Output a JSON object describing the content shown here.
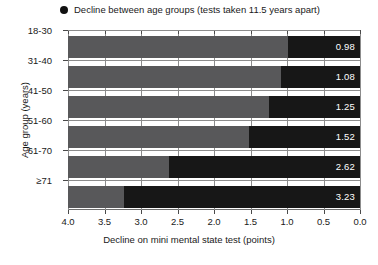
{
  "chart_data": {
    "type": "bar",
    "orientation": "horizontal",
    "title": "",
    "legend": {
      "position": "top-left",
      "marker": "filled-circle",
      "marker_color": "#111111",
      "entries": [
        {
          "label": "Decline between age groups (tests taken 11.5 years apart)"
        }
      ]
    },
    "categories": [
      "18-30",
      "31-40",
      "41-50",
      "51-60",
      "61-70",
      "≥71"
    ],
    "values": [
      0.98,
      1.08,
      1.25,
      1.52,
      2.62,
      3.23
    ],
    "data_labels": [
      "0.98",
      "1.08",
      "1.25",
      "1.52",
      "2.62",
      "3.23"
    ],
    "xlabel": "Decline on mini mental state test (points)",
    "ylabel": "Age group (years)",
    "xlim": [
      4.0,
      0.0
    ],
    "x_axis_reversed": true,
    "xticks": [
      4.0,
      3.5,
      3.0,
      2.5,
      2.0,
      1.5,
      1.0,
      0.5,
      0.0
    ],
    "xtick_labels": [
      "4.0",
      "3.5",
      "3.0",
      "2.5",
      "2.0",
      "1.5",
      "1.0",
      "0.5",
      "0.0"
    ],
    "grid": "vertical",
    "series": [
      {
        "name": "Decline between age groups (tests taken 11.5 years apart)",
        "color": "#171717",
        "values": [
          0.98,
          1.08,
          1.25,
          1.52,
          2.62,
          3.23
        ]
      },
      {
        "name": "Remainder of scale",
        "color": "#58585a",
        "values": [
          3.02,
          2.92,
          2.75,
          2.48,
          1.38,
          0.77
        ]
      }
    ]
  },
  "colors": {
    "bar_dark": "#171717",
    "bar_gray": "#58585a",
    "gridline": "#8c8c8c",
    "axis": "#6e6e6e",
    "text": "#1a1a1a",
    "value_label": "#ffffff",
    "background": "#ffffff"
  }
}
